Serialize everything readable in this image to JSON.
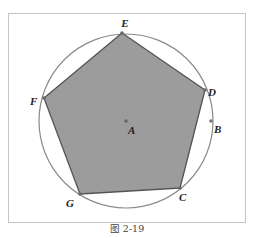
{
  "figure": {
    "caption": "图 2-19",
    "colors": {
      "frame": "#c4c4c4",
      "circle": "#8a8a8a",
      "polygon_fill": "#9c9c9c",
      "polygon_stroke": "#555555",
      "point": "#666666",
      "label": "#222222"
    },
    "circle": {
      "center_label": "A",
      "cx": 126,
      "cy": 121,
      "r": 87
    },
    "polygon": {
      "type": "regular pentagon",
      "vertices": [
        {
          "label": "E",
          "x": 122,
          "y": 33
        },
        {
          "label": "D",
          "x": 205,
          "y": 90
        },
        {
          "label": "C",
          "x": 180,
          "y": 188
        },
        {
          "label": "G",
          "x": 80,
          "y": 194
        },
        {
          "label": "F",
          "x": 44,
          "y": 98
        }
      ]
    },
    "points": [
      {
        "label": "A",
        "x": 126,
        "y": 121
      },
      {
        "label": "B",
        "x": 211,
        "y": 121
      }
    ],
    "labels": {
      "E": "E",
      "D": "D",
      "C": "C",
      "G": "G",
      "F": "F",
      "A": "A",
      "B": "B"
    }
  }
}
